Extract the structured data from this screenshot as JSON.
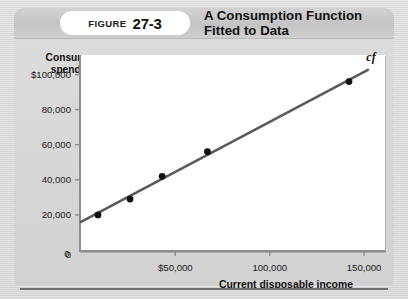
{
  "figure": {
    "label_word": "Figure",
    "number": "27-3",
    "title": "A Consumption Function Fitted to Data"
  },
  "chart_data": {
    "type": "scatter",
    "title": "A Consumption Function Fitted to Data",
    "xlabel": "Current disposable income",
    "ylabel": "Consumer spending",
    "xlim": [
      0,
      160000
    ],
    "ylim": [
      0,
      110000
    ],
    "grid": false,
    "legend": "none",
    "xticks": [
      {
        "value": 0,
        "label": "0"
      },
      {
        "value": 50000,
        "label": "$50,000"
      },
      {
        "value": 100000,
        "label": "100,000"
      },
      {
        "value": 150000,
        "label": "150,000"
      }
    ],
    "yticks": [
      {
        "value": 0,
        "label": "0"
      },
      {
        "value": 20000,
        "label": "20,000"
      },
      {
        "value": 40000,
        "label": "40,000"
      },
      {
        "value": 60000,
        "label": "60,000"
      },
      {
        "value": 80000,
        "label": "80,000"
      },
      {
        "value": 100000,
        "label": "$100,000"
      }
    ],
    "points": [
      {
        "x": 9000,
        "y": 20000
      },
      {
        "x": 26000,
        "y": 29000
      },
      {
        "x": 43000,
        "y": 42000
      },
      {
        "x": 67000,
        "y": 56000
      },
      {
        "x": 142000,
        "y": 96000
      }
    ],
    "series": [
      {
        "name": "cf",
        "type": "line",
        "annotation": "cf",
        "intercept": 16000,
        "slope": 0.57,
        "x_start": 0,
        "x_end": 152000
      }
    ],
    "colors": {
      "line": "#5b5b5b",
      "point": "#111111",
      "axis": "#8d8d8d",
      "plot_background": "#ffffff",
      "page_background": "#d7d7d7"
    }
  }
}
